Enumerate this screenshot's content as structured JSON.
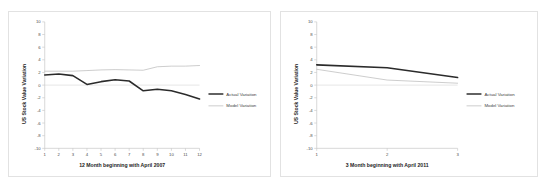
{
  "figure": {
    "background_color": "#ffffff",
    "panel_border_color": "#e2e2e2"
  },
  "colors": {
    "actual_series": "#2b2b2b",
    "model_series": "#b9b9b9",
    "axis": "#c8c8c8",
    "text": "#1c1c1c"
  },
  "chart_data": [
    {
      "id": "left",
      "type": "line",
      "title": "",
      "xlabel": "12 Month beginning with April 2007",
      "ylabel": "US Stock Value Variation",
      "x": [
        1,
        2,
        3,
        4,
        5,
        6,
        7,
        8,
        9,
        10,
        11,
        12
      ],
      "xticklabels": [
        "1",
        "2",
        "3",
        "4",
        "5",
        "6",
        "7",
        "8",
        "9",
        "10",
        "11",
        "12"
      ],
      "yticklabels": [
        "10",
        "8",
        "6",
        "4",
        "2",
        "0",
        "-2",
        "-4",
        "-6",
        "-8",
        "-10"
      ],
      "yticks": [
        10,
        8,
        6,
        4,
        2,
        0,
        -2,
        -4,
        -6,
        -8,
        -10
      ],
      "ylim": [
        -10,
        10
      ],
      "xlim": [
        1,
        12
      ],
      "grid": false,
      "legend_position": "right",
      "series": [
        {
          "name": "Actual Variation",
          "values": [
            1.6,
            1.75,
            1.5,
            0.1,
            0.55,
            0.85,
            0.65,
            -0.9,
            -0.65,
            -0.9,
            -1.5,
            -2.2
          ]
        },
        {
          "name": "Model Variation",
          "values": [
            2.2,
            2.2,
            2.2,
            2.3,
            2.4,
            2.45,
            2.4,
            2.35,
            2.9,
            3.0,
            3.0,
            3.1
          ]
        }
      ]
    },
    {
      "id": "right",
      "type": "line",
      "title": "",
      "xlabel": "3 Month beginning with April 2011",
      "ylabel": "US Stock Value Variation",
      "x": [
        1,
        2,
        3
      ],
      "xticklabels": [
        "1",
        "2",
        "3"
      ],
      "yticklabels": [
        "10",
        "8",
        "6",
        "4",
        "2",
        "0",
        "-2",
        "-4",
        "-6",
        "-8",
        "-10"
      ],
      "yticks": [
        10,
        8,
        6,
        4,
        2,
        0,
        -2,
        -4,
        -6,
        -8,
        -10
      ],
      "ylim": [
        -10,
        10
      ],
      "xlim": [
        1,
        3
      ],
      "grid": false,
      "legend_position": "right",
      "series": [
        {
          "name": "Actual Variation",
          "values": [
            3.2,
            2.75,
            1.2
          ]
        },
        {
          "name": "Model Variation",
          "values": [
            2.5,
            0.8,
            0.3
          ]
        }
      ]
    }
  ],
  "left_chart": {
    "xlabel": "12 Month beginning with April 2007",
    "ylabel": "US Stock Value Variation",
    "yticks": [
      "10",
      "8",
      "6",
      "4",
      "2",
      "0",
      "-2",
      "-4",
      "-6",
      "-8",
      "-10"
    ],
    "xticks": [
      "1",
      "2",
      "3",
      "4",
      "5",
      "6",
      "7",
      "8",
      "9",
      "10",
      "11",
      "12"
    ],
    "legend": [
      {
        "label": "Actual Variation",
        "style": "thick-dark"
      },
      {
        "label": "Model Variation",
        "style": "thin-light"
      }
    ]
  },
  "right_chart": {
    "xlabel": "3 Month beginning with April 2011",
    "ylabel": "US Stock Value Variation",
    "yticks": [
      "10",
      "8",
      "6",
      "4",
      "2",
      "0",
      "-2",
      "-4",
      "-6",
      "-8",
      "-10"
    ],
    "xticks": [
      "1",
      "2",
      "3"
    ],
    "legend": [
      {
        "label": "Actual Variation",
        "style": "thick-dark"
      },
      {
        "label": "Model Variation",
        "style": "thin-light"
      }
    ]
  }
}
